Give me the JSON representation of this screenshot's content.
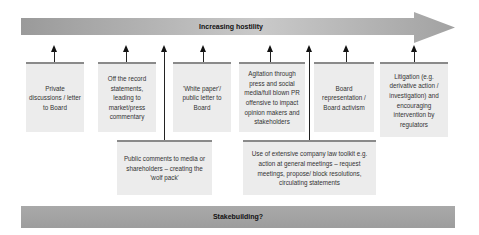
{
  "top_arrow": {
    "label": "Increasing hostility",
    "color": "#a0a0a0"
  },
  "bottom_bar": {
    "label": "Stakebuilding?",
    "color": "#a3a3a3"
  },
  "upper_boxes": [
    {
      "text": "Private discussions / letter to Board"
    },
    {
      "text": "Off the record statements, leading to market/press commentary"
    },
    {
      "text": "'White paper'/ public letter to Board"
    },
    {
      "text": "Agitation through press and social media/full blown PR offensive to impact opinion makers and stakeholders"
    },
    {
      "text": "Board representation / Board activism"
    },
    {
      "text": "Litigation (e.g. derivative action / investigation) and encouraging intervention by regulators"
    }
  ],
  "lower_boxes": [
    {
      "text": "Public comments to media or shareholders – creating the 'wolf pack'"
    },
    {
      "text": "Use of extensive company law toolkit e.g. action at general meetings – request meetings, propose/ block resolutions, circulating statements"
    }
  ]
}
